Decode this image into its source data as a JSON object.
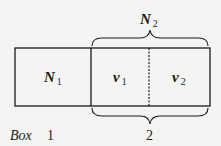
{
  "diagram": {
    "top_brace": {
      "label_main": "N",
      "label_sub": "2"
    },
    "compartments": [
      {
        "label_main": "N",
        "label_sub": "1"
      },
      {
        "label_main": "v",
        "label_sub": "1"
      },
      {
        "label_main": "v",
        "label_sub": "2"
      }
    ],
    "bottom_row": {
      "box_word": "Box",
      "box_1": "1",
      "box_2": "2"
    },
    "styles": {
      "line_color": "#1a1a1a",
      "background": "#f4f4f2",
      "divider_between_v1_v2": "dashed"
    }
  }
}
